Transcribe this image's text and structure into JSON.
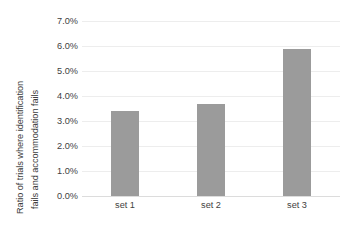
{
  "chart_data": {
    "type": "bar",
    "title": "",
    "subtitle": "",
    "xlabel": "",
    "ylabel": "Ratio of trials where identification fails and accommodation fails",
    "ylabel_lines": [
      "Ratio of trials where identification",
      "fails and accommodation fails"
    ],
    "categories": [
      "set 1",
      "set 2",
      "set 3"
    ],
    "values": [
      3.4,
      3.7,
      5.9
    ],
    "value_labels": [
      "3.4%",
      "3.7%",
      "5.9%"
    ],
    "ylim": [
      0.0,
      7.0
    ],
    "ytick_values": [
      7.0,
      6.0,
      5.0,
      4.0,
      3.0,
      2.0,
      1.0,
      0.0
    ],
    "ytick_labels": [
      "7.0%",
      "6.0%",
      "5.0%",
      "4.0%",
      "3.0%",
      "2.0%",
      "1.0%",
      "0.0%"
    ],
    "grid": true,
    "legend": false,
    "legend_position": "none",
    "series": [
      {
        "name": "",
        "values": [
          3.4,
          3.7,
          5.9
        ]
      }
    ]
  },
  "style": {
    "bar_color": "#9b9b9b",
    "grid_color": "#ededed",
    "axis_color": "#dcdcdc",
    "text_color": "#3f3f3f",
    "background": "#ffffff"
  }
}
